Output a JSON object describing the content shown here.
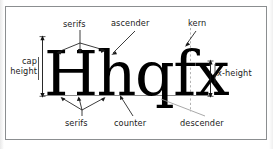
{
  "diagram": {
    "specimen_text": "Hhqfx",
    "specimen_letters": [
      "H",
      "h",
      "q",
      "f",
      "x"
    ],
    "frame_border_color": "#8b8e90",
    "background_color": "#ffffff",
    "ink_color": "#000000",
    "leader_line_color": "#1a1a1a",
    "baseline_color": "#8a8a8a",
    "kern_guide_color": "#9a9a9a",
    "labels": {
      "serifs_top": "serifs",
      "ascender": "ascender",
      "kern": "kern",
      "cap_height_line1": "cap",
      "cap_height_line2": "height",
      "x_height": "x-height",
      "serifs_bottom": "serifs",
      "counter": "counter",
      "descender": "descender"
    },
    "measures": [
      {
        "name": "cap-height",
        "label": "cap height",
        "side": "left"
      },
      {
        "name": "x-height",
        "label": "x-height",
        "side": "right"
      }
    ],
    "callouts": [
      {
        "name": "serifs-top",
        "label": "serifs",
        "position": "top-left",
        "targets": 3
      },
      {
        "name": "ascender",
        "label": "ascender",
        "position": "top-center",
        "targets": 1
      },
      {
        "name": "kern",
        "label": "kern",
        "position": "top-right",
        "targets": 1
      },
      {
        "name": "serifs-bottom",
        "label": "serifs",
        "position": "bottom-left",
        "targets": 3
      },
      {
        "name": "counter",
        "label": "counter",
        "position": "bottom-center",
        "targets": 1
      },
      {
        "name": "descender",
        "label": "descender",
        "position": "bottom-right",
        "targets": 1
      }
    ]
  }
}
